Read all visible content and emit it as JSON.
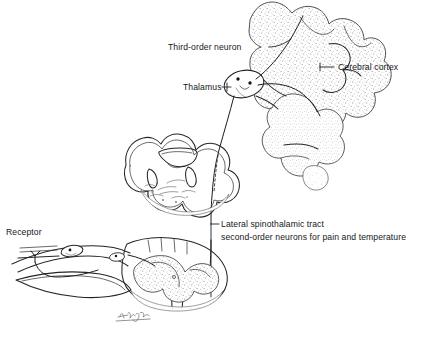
{
  "figure": {
    "background_color": "#ffffff",
    "ink_color": "#232527",
    "width": 438,
    "height": 338
  },
  "labels": {
    "third_order_neuron": "Third-order neuron",
    "cerebral_cortex": "Cerebral cortex",
    "thalamus": "Thalamus",
    "tract_line1": "Lateral spinothalamic tract",
    "tract_line2": "second-order neurons for pain and temperature",
    "receptor": "Receptor"
  },
  "structures": [
    {
      "name": "cerebral-cortex",
      "description": "stippled cortical gyri, upper right"
    },
    {
      "name": "thalamus",
      "description": "small oval nucleus with two synapse dots"
    },
    {
      "name": "medulla-cross-section",
      "description": "medulla oblongata transverse section, middle left"
    },
    {
      "name": "spinal-cord-cross-section",
      "description": "spinal cord transverse section with dorsal root ganglion, lower left"
    },
    {
      "name": "receptor",
      "description": "free nerve ending in skin layers, far left"
    }
  ],
  "pathway": {
    "segments": [
      "receptor to dorsal root ganglion",
      "first-order neuron into dorsal horn",
      "decussation and ascent as lateral spinothalamic tract",
      "through medulla",
      "synapse in thalamus",
      "third-order neuron to cerebral cortex"
    ]
  },
  "signature": {
    "text": "Hoyt"
  }
}
